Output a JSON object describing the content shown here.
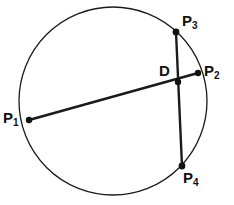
{
  "figure": {
    "width": 234,
    "height": 205,
    "background_color": "#ffffff",
    "stroke_color": "#1a1a1a",
    "label_color": "#111111",
    "circle_stroke_width": 1.3,
    "chord_stroke_width": 2.4,
    "point_radius": 3.2
  },
  "circle": {
    "name": "circle",
    "cx": 113,
    "cy": 101,
    "r": 94
  },
  "points": [
    {
      "id": "P1",
      "base": "P",
      "sub": "1",
      "x": 29,
      "y": 120,
      "label_dx": -26,
      "label_dy": -10
    },
    {
      "id": "P2",
      "base": "P",
      "sub": "2",
      "x": 198,
      "y": 73,
      "label_dx": 6,
      "label_dy": -10
    },
    {
      "id": "P3",
      "base": "P",
      "sub": "3",
      "x": 176,
      "y": 32,
      "label_dx": 6,
      "label_dy": -19
    },
    {
      "id": "P4",
      "base": "P",
      "sub": "4",
      "x": 182,
      "y": 166,
      "label_dx": 1,
      "label_dy": 4
    },
    {
      "id": "D",
      "base": "D",
      "sub": "",
      "x": 178,
      "y": 82,
      "label_dx": -19,
      "label_dy": -19
    }
  ],
  "chords": [
    {
      "id": "chord-P1-P2",
      "from": "P1",
      "to": "P2",
      "x1": 29,
      "y1": 120,
      "x2": 198,
      "y2": 73
    },
    {
      "id": "chord-P3-P4",
      "from": "P3",
      "to": "P4",
      "x1": 176,
      "y1": 32,
      "x2": 182,
      "y2": 166
    }
  ],
  "labels": {
    "P1": "P",
    "P1_sub": "1",
    "P2": "P",
    "P2_sub": "2",
    "P3": "P",
    "P3_sub": "3",
    "P4": "P",
    "P4_sub": "4",
    "D": "D"
  }
}
